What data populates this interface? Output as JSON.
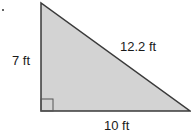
{
  "figure": {
    "type": "right-triangle",
    "bullet": ".",
    "colors": {
      "fill": "#d3d3d3",
      "stroke": "#3a3a3a",
      "text": "#1a1a1a"
    },
    "sides": {
      "vertical_leg": {
        "length": 7,
        "unit": "ft",
        "label": "7 ft"
      },
      "horizontal_leg": {
        "length": 10,
        "unit": "ft",
        "label": "10 ft"
      },
      "hypotenuse": {
        "length": 12.2,
        "unit": "ft",
        "label": "12.2 ft"
      }
    },
    "right_angle_marker": "bottom-left"
  }
}
